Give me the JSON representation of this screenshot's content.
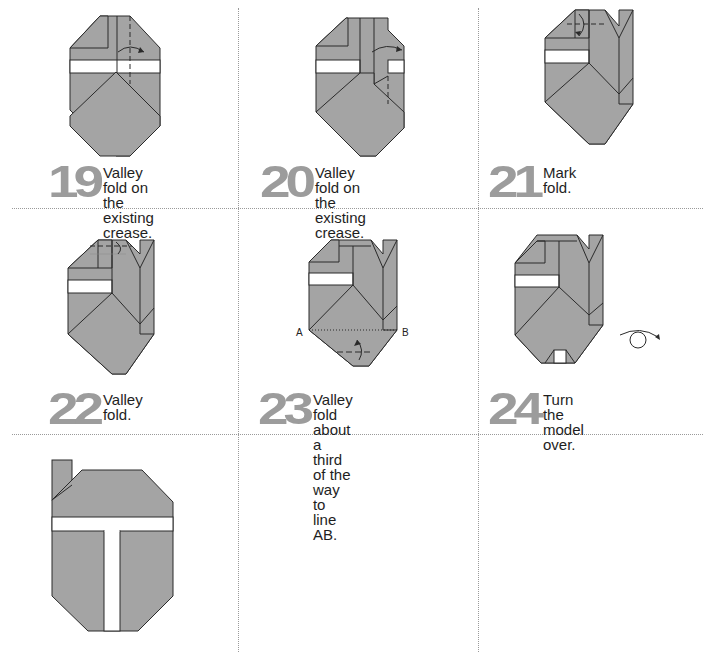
{
  "colors": {
    "paper": "#a4a4a4",
    "white_band": "#ffffff",
    "outline": "#2a2a2a",
    "step_number": "#9c9c9c",
    "divider": "#9a9a9a"
  },
  "steps": [
    {
      "number": "19",
      "text_line1": "Valley fold on the",
      "text_line2": "existing crease."
    },
    {
      "number": "20",
      "text_line1": "Valley fold on the",
      "text_line2": "existing crease."
    },
    {
      "number": "21",
      "text_line1": "Mark fold.",
      "text_line2": ""
    },
    {
      "number": "22",
      "text_line1": "Valley fold.",
      "text_line2": ""
    },
    {
      "number": "23",
      "text_line1": "Valley fold about a third",
      "text_line2": "of the way to line AB.",
      "label_a": "A",
      "label_b": "B"
    },
    {
      "number": "24",
      "text_line1": "Turn the model over.",
      "text_line2": "",
      "icon": "turn-over-icon"
    },
    {
      "number": "",
      "text_line1": "",
      "text_line2": "",
      "note": "finished model"
    }
  ]
}
